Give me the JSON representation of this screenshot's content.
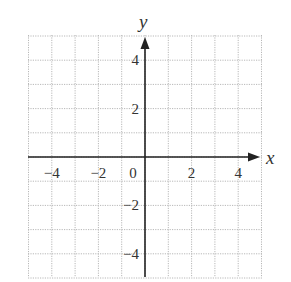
{
  "diagram": {
    "type": "coordinate-plane",
    "x_axis": {
      "label": "x",
      "min": -5,
      "max": 5,
      "tick_labels": [
        {
          "value": -4,
          "text": "−4"
        },
        {
          "value": -2,
          "text": "−2"
        },
        {
          "value": 0,
          "text": "0"
        },
        {
          "value": 2,
          "text": "2"
        },
        {
          "value": 4,
          "text": "4"
        }
      ]
    },
    "y_axis": {
      "label": "y",
      "min": -5,
      "max": 5,
      "tick_labels": [
        {
          "value": 4,
          "text": "4"
        },
        {
          "value": 2,
          "text": "2"
        },
        {
          "value": -2,
          "text": "−2"
        },
        {
          "value": -4,
          "text": "−4"
        }
      ]
    },
    "grid": {
      "style": "dotted",
      "color": "#b8b8b8",
      "step": 1
    },
    "axis_color": "#222222"
  }
}
